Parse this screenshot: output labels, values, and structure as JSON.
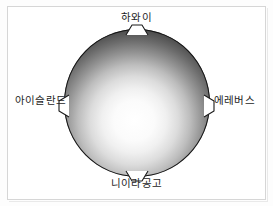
{
  "figure": {
    "subject_icon": "sphere-icon",
    "background_color": "#ffffff",
    "frame_color": "#d6d6d6",
    "sphere": {
      "label": "지구",
      "shading": "radial-gradient",
      "highlight_color": "#ffffff",
      "edge_color": "#111111",
      "highlight_position": "48% 62%"
    },
    "hotspots": [
      {
        "id": "hotspot-top",
        "name": "하와이",
        "position": "top",
        "marker_icon": "trapezoid-tab-icon"
      },
      {
        "id": "hotspot-right",
        "name": "에레버스",
        "position": "right",
        "marker_icon": "trapezoid-tab-icon"
      },
      {
        "id": "hotspot-bottom",
        "name": "니이라공고",
        "position": "bottom",
        "marker_icon": "trapezoid-tab-icon"
      },
      {
        "id": "hotspot-left",
        "name": "아이슬란드",
        "position": "left",
        "marker_icon": "trapezoid-tab-icon"
      }
    ]
  }
}
